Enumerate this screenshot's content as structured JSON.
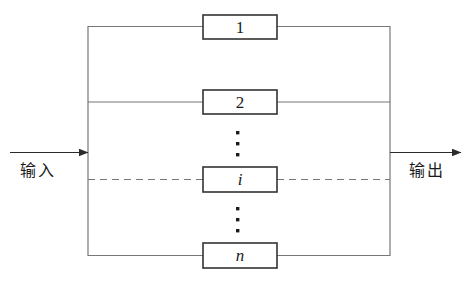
{
  "diagram": {
    "type": "parallel-block-diagram",
    "title": "",
    "background_color": "#ffffff",
    "line_color": "#555555",
    "box_border_color": "#333333",
    "text_color": "#1a1a1a",
    "input": {
      "label": "输入",
      "arrow": "arrow-right"
    },
    "output": {
      "label": "输出",
      "arrow": "arrow-right"
    },
    "blocks": [
      {
        "id": "block-1",
        "label": "1",
        "style": "upright"
      },
      {
        "id": "block-2",
        "label": "2",
        "style": "upright"
      },
      {
        "id": "block-i",
        "label": "i",
        "style": "italic"
      },
      {
        "id": "block-n",
        "label": "n",
        "style": "italic"
      }
    ],
    "ellipses": [
      {
        "id": "ellipsis-upper",
        "label": "⋮"
      },
      {
        "id": "ellipsis-lower",
        "label": "⋮"
      }
    ]
  }
}
